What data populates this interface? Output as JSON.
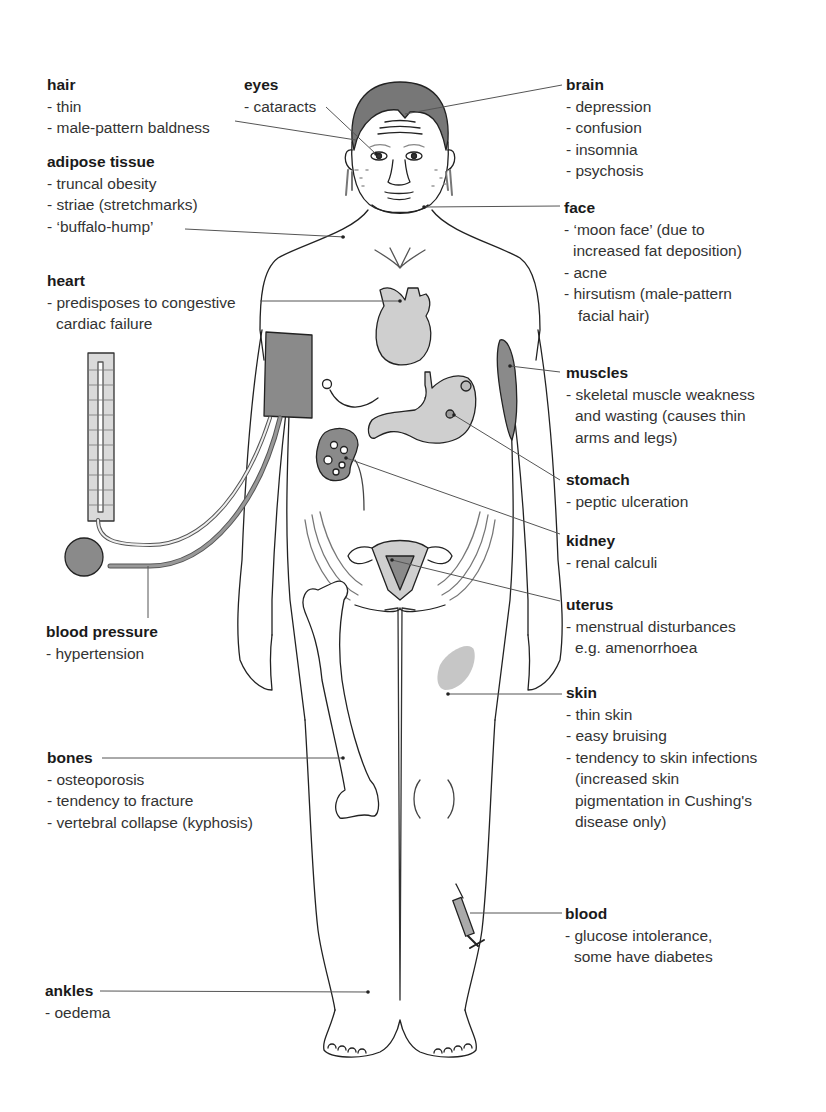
{
  "figure": {
    "colors": {
      "line": "#222222",
      "leader": "#555555",
      "organ_fill": "#cfcfcf",
      "dark_fill": "#8a8a8a",
      "hair_fill": "#777777"
    }
  },
  "labels": {
    "hair": {
      "title": "hair",
      "items": [
        "- thin",
        "- male-pattern baldness"
      ]
    },
    "eyes": {
      "title": "eyes",
      "items": [
        "- cataracts"
      ]
    },
    "brain": {
      "title": "brain",
      "items": [
        "- depression",
        "- confusion",
        "- insomnia",
        "- psychosis"
      ]
    },
    "adipose": {
      "title": "adipose tissue",
      "items": [
        "- truncal obesity",
        "- striae (stretchmarks)",
        "- ‘buffalo-hump’"
      ]
    },
    "face": {
      "title": "face",
      "items": [
        "- ‘moon face’ (due to",
        "increased fat deposition)",
        "- acne",
        "- hirsutism (male-pattern",
        "facial hair)"
      ]
    },
    "heart": {
      "title": "heart",
      "items": [
        "- predisposes to congestive",
        "cardiac failure"
      ]
    },
    "muscles": {
      "title": "muscles",
      "items": [
        "- skeletal muscle weakness",
        "and wasting (causes thin",
        "arms and legs)"
      ]
    },
    "stomach": {
      "title": "stomach",
      "items": [
        "- peptic ulceration"
      ]
    },
    "kidney": {
      "title": "kidney",
      "items": [
        "- renal calculi"
      ]
    },
    "uterus": {
      "title": "uterus",
      "items": [
        "- menstrual disturbances",
        "e.g. amenorrhoea"
      ]
    },
    "blood_pressure": {
      "title": "blood pressure",
      "items": [
        "- hypertension"
      ]
    },
    "skin": {
      "title": "skin",
      "items": [
        "- thin skin",
        "- easy bruising",
        "- tendency to skin infections",
        "(increased skin",
        "pigmentation in Cushing's",
        "disease only)"
      ]
    },
    "bones": {
      "title": "bones",
      "items": [
        "- osteoporosis",
        "- tendency to fracture",
        "- vertebral collapse (kyphosis)"
      ]
    },
    "blood": {
      "title": "blood",
      "items": [
        "- glucose intolerance,",
        "some have diabetes"
      ]
    },
    "ankles": {
      "title": "ankles",
      "items": [
        "- oedema"
      ]
    }
  }
}
